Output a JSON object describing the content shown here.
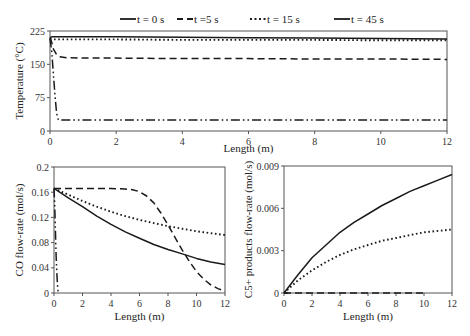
{
  "legend": [
    {
      "label": "t = 0 s",
      "style": "solid"
    },
    {
      "label": "t =5 s",
      "style": "dashed"
    },
    {
      "label": "t = 15 s",
      "style": "dotted"
    },
    {
      "label": "t = 45 s",
      "style": "dashdot"
    }
  ],
  "chart_data": [
    {
      "type": "line",
      "title": "",
      "xlabel": "Length (m)",
      "ylabel": "Temperature (°C)",
      "xlim": [
        0,
        12
      ],
      "ylim": [
        0,
        225
      ],
      "xticks": [
        0,
        2,
        4,
        6,
        8,
        10,
        12
      ],
      "yticks": [
        0,
        75,
        150,
        225
      ],
      "grid": false,
      "legend_position": "top",
      "series": [
        {
          "name": "t = 0 s",
          "style": "solid",
          "x": [
            0,
            0.05,
            2,
            4,
            6,
            8,
            10,
            12
          ],
          "y": [
            210,
            212,
            212,
            211,
            210,
            209,
            208,
            207
          ]
        },
        {
          "name": "t =5 s",
          "style": "dashed",
          "x": [
            0,
            0.05,
            0.1,
            0.2,
            0.3,
            0.5,
            1,
            2,
            4,
            6,
            8,
            10,
            12
          ],
          "y": [
            210,
            200,
            185,
            172,
            167,
            165,
            164,
            164,
            163,
            163,
            162,
            162,
            161
          ]
        },
        {
          "name": "t = 15 s",
          "style": "dotted",
          "x": [
            0,
            0.05,
            2,
            4,
            6,
            8,
            10,
            12
          ],
          "y": [
            208,
            206,
            206,
            205,
            205,
            205,
            204,
            204
          ]
        },
        {
          "name": "t = 45 s",
          "style": "dashdot",
          "x": [
            0,
            0.05,
            0.1,
            0.15,
            0.2,
            0.25,
            0.35,
            12
          ],
          "y": [
            208,
            180,
            130,
            80,
            40,
            25,
            25,
            25
          ]
        }
      ]
    },
    {
      "type": "line",
      "title": "",
      "xlabel": "Length (m)",
      "ylabel": "CO flow-rate (mol/s)",
      "xlim": [
        0,
        12
      ],
      "ylim": [
        0,
        0.2
      ],
      "xticks": [
        0,
        2,
        4,
        6,
        8,
        10,
        12
      ],
      "yticks": [
        0,
        0.04,
        0.08,
        0.12,
        0.16,
        0.2
      ],
      "grid": false,
      "series": [
        {
          "name": "t = 0 s",
          "style": "solid",
          "x": [
            0,
            1,
            2,
            3,
            4,
            5,
            6,
            7,
            8,
            9,
            10,
            11,
            12
          ],
          "y": [
            0.166,
            0.151,
            0.137,
            0.122,
            0.109,
            0.097,
            0.087,
            0.077,
            0.069,
            0.062,
            0.055,
            0.049,
            0.045
          ]
        },
        {
          "name": "t =5 s",
          "style": "dashed",
          "x": [
            0,
            1,
            2,
            3,
            4,
            5,
            5.5,
            6,
            6.5,
            7,
            7.5,
            8,
            8.5,
            9,
            9.5,
            10,
            10.5,
            11,
            11.5,
            12
          ],
          "y": [
            0.166,
            0.166,
            0.166,
            0.166,
            0.166,
            0.165,
            0.164,
            0.161,
            0.154,
            0.143,
            0.127,
            0.108,
            0.088,
            0.068,
            0.05,
            0.034,
            0.022,
            0.013,
            0.007,
            0.003
          ]
        },
        {
          "name": "t = 15 s",
          "style": "dotted",
          "x": [
            0,
            1,
            2,
            3,
            4,
            5,
            6,
            7,
            8,
            9,
            10,
            11,
            12
          ],
          "y": [
            0.166,
            0.156,
            0.146,
            0.137,
            0.129,
            0.122,
            0.116,
            0.111,
            0.106,
            0.102,
            0.098,
            0.095,
            0.092
          ]
        },
        {
          "name": "t = 45 s",
          "style": "dashdot",
          "x": [
            0,
            0.05,
            0.1,
            0.15,
            0.2,
            0.25,
            0.3
          ],
          "y": [
            0.166,
            0.14,
            0.1,
            0.06,
            0.03,
            0.01,
            0.0
          ]
        }
      ]
    },
    {
      "type": "line",
      "title": "",
      "xlabel": "Length (m)",
      "ylabel": "C5+ products flow-rate (mol/s)",
      "xlim": [
        0,
        12
      ],
      "ylim": [
        0,
        0.009
      ],
      "xticks": [
        0,
        2,
        4,
        6,
        8,
        10,
        12
      ],
      "yticks": [
        0,
        0.003,
        0.006,
        0.009
      ],
      "grid": false,
      "series": [
        {
          "name": "t = 0 s",
          "style": "solid",
          "x": [
            0,
            1,
            2,
            3,
            4,
            5,
            6,
            7,
            8,
            9,
            10,
            11,
            12
          ],
          "y": [
            0,
            0.0013,
            0.0025,
            0.0034,
            0.0043,
            0.005,
            0.0056,
            0.0062,
            0.0067,
            0.0072,
            0.0076,
            0.008,
            0.0084
          ]
        },
        {
          "name": "t =5 s",
          "style": "dashed",
          "x": [
            0,
            2,
            4,
            6,
            8,
            10
          ],
          "y": [
            0,
            0,
            0,
            0,
            0,
            0
          ]
        },
        {
          "name": "t = 15 s",
          "style": "dotted",
          "x": [
            0,
            1,
            2,
            3,
            4,
            5,
            6,
            7,
            8,
            9,
            10,
            11,
            12
          ],
          "y": [
            0,
            0.0009,
            0.0016,
            0.0022,
            0.0027,
            0.0031,
            0.0034,
            0.0037,
            0.0039,
            0.0041,
            0.0043,
            0.0044,
            0.0045
          ]
        },
        {
          "name": "t = 45 s",
          "style": "dashdot",
          "x": [
            0,
            0.3
          ],
          "y": [
            0,
            0
          ]
        }
      ]
    }
  ],
  "layout": {
    "panels": [
      {
        "x0": 50,
        "x1": 447,
        "y0": 31,
        "y1": 131,
        "xtitle_y": 152,
        "ytitle_x": 15
      },
      {
        "x0": 54,
        "x1": 225,
        "y0": 167,
        "y1": 293,
        "xtitle_y": 328,
        "ytitle_x": 15
      },
      {
        "x0": 284,
        "x1": 452,
        "y0": 166,
        "y1": 293,
        "xtitle_y": 328,
        "ytitle_x": 244
      }
    ],
    "legend_x": [
      120,
      177,
      250,
      334
    ],
    "line_color": "#1a1a1a",
    "axis_color": "#555555"
  }
}
